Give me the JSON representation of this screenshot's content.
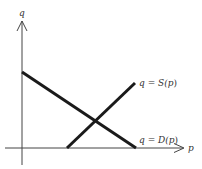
{
  "diagram": {
    "type": "supply-demand",
    "axes": {
      "x_label": "p",
      "y_label": "q"
    },
    "curves": [
      {
        "id": "supply",
        "label": "q = S(p)",
        "label_parts": [
          "q",
          " = ",
          "S(",
          "p",
          ")"
        ]
      },
      {
        "id": "demand",
        "label": "q = D(p)",
        "label_parts": [
          "q",
          " = ",
          "D(",
          "p",
          ")"
        ]
      }
    ],
    "colors": {
      "axis": "#444444",
      "curve": "#1a1a1a",
      "text": "#333333"
    }
  }
}
